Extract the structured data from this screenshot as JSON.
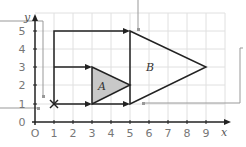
{
  "diagram": {
    "type": "coordinate-grid-transformation",
    "axes": {
      "x_label": "x",
      "y_label": "y",
      "origin_label": "O",
      "x_ticks": [
        "0",
        "1",
        "2",
        "3",
        "4",
        "5",
        "6",
        "7",
        "8",
        "9"
      ],
      "y_ticks": [
        "0",
        "1",
        "2",
        "3",
        "4",
        "5"
      ]
    },
    "shapes": {
      "A": {
        "label": "A",
        "vertices": [
          [
            3,
            1
          ],
          [
            3,
            3
          ],
          [
            5,
            2
          ]
        ],
        "fill": "#c8c8c8"
      },
      "B": {
        "label": "B",
        "vertices": [
          [
            5,
            1
          ],
          [
            5,
            5
          ],
          [
            9,
            3
          ]
        ],
        "fill": "none"
      }
    },
    "center_point": {
      "marker": "×",
      "coords": [
        1,
        1
      ]
    },
    "rays": [
      {
        "from": [
          1,
          1
        ],
        "to": [
          1,
          5
        ]
      },
      {
        "from": [
          1,
          5
        ],
        "to": [
          5,
          5
        ]
      },
      {
        "from": [
          1,
          3
        ],
        "to": [
          3,
          3
        ]
      },
      {
        "from": [
          1,
          1
        ],
        "to": [
          3,
          1
        ]
      },
      {
        "from": [
          3,
          1
        ],
        "to": [
          5,
          1
        ]
      }
    ],
    "colors": {
      "grid": "#dddddd",
      "lines": "#222222",
      "callouts": "#999999"
    }
  }
}
